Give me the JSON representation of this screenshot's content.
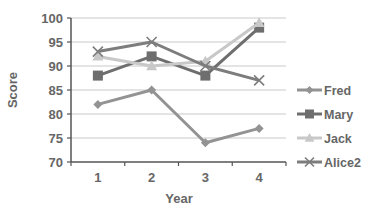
{
  "chart_data": {
    "type": "line",
    "title": "",
    "xlabel": "Year",
    "ylabel": "Score",
    "categories": [
      "1",
      "2",
      "3",
      "4"
    ],
    "ylim": [
      70,
      100
    ],
    "yticks": [
      70,
      75,
      80,
      85,
      90,
      95,
      100
    ],
    "grid": true,
    "legend_position": "right",
    "series": [
      {
        "name": "Fred",
        "values": [
          82,
          85,
          74,
          77
        ],
        "marker": "diamond",
        "color": "#939393"
      },
      {
        "name": "Mary",
        "values": [
          88,
          92,
          88,
          98
        ],
        "marker": "square",
        "color": "#6e6e6e"
      },
      {
        "name": "Jack",
        "values": [
          92,
          90,
          91,
          99
        ],
        "marker": "triangle",
        "color": "#c8c8c8"
      },
      {
        "name": "Alice2",
        "values": [
          93,
          95,
          90,
          87
        ],
        "marker": "x",
        "color": "#7d7d7d"
      }
    ]
  }
}
